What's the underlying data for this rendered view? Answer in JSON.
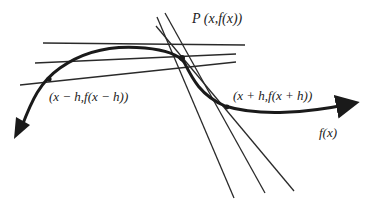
{
  "diagram": {
    "type": "tangent-limit-of-secants",
    "labels": {
      "point_p": "P (x,f(x))",
      "point_left": "(x − h,f(x − h))",
      "point_right": "(x + h,f(x + h))",
      "function": "f(x)"
    },
    "colors": {
      "curve": "#1a1a1a",
      "lines": "#2a2a2a",
      "text": "#222222",
      "background": "#ffffff"
    },
    "point_p": [
      182,
      58
    ],
    "point_left": [
      49,
      79
    ],
    "point_right": [
      227,
      107
    ],
    "left_secants": [
      [
        [
          43,
          43
        ],
        [
          245,
          45
        ]
      ],
      [
        [
          35,
          63
        ],
        [
          236,
          54
        ]
      ],
      [
        [
          20,
          85
        ],
        [
          236,
          62
        ]
      ]
    ],
    "right_secants": [
      [
        [
          157,
          17
        ],
        [
          234,
          198
        ]
      ],
      [
        [
          165,
          13
        ],
        [
          265,
          193
        ]
      ],
      [
        [
          156,
          26
        ],
        [
          294,
          191
        ]
      ]
    ]
  }
}
